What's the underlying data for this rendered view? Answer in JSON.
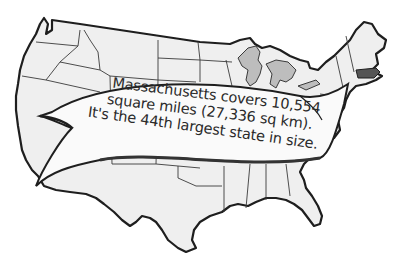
{
  "map": {
    "subject": "Contiguous United States outline map",
    "highlighted_state": "Massachusetts",
    "colors": {
      "background": "#ffffff",
      "land_fill": "#efefef",
      "state_border": "#3a3a3a",
      "outline": "#1e1e1e",
      "great_lakes": "#bdbdbd",
      "highlight": "#555555",
      "banner_fill": "#fafafa"
    }
  },
  "banner": {
    "line1": "Massachusetts covers 10,554",
    "line2": "square miles (27,336 sq km).",
    "line3": "It's the 44th largest state in size."
  }
}
